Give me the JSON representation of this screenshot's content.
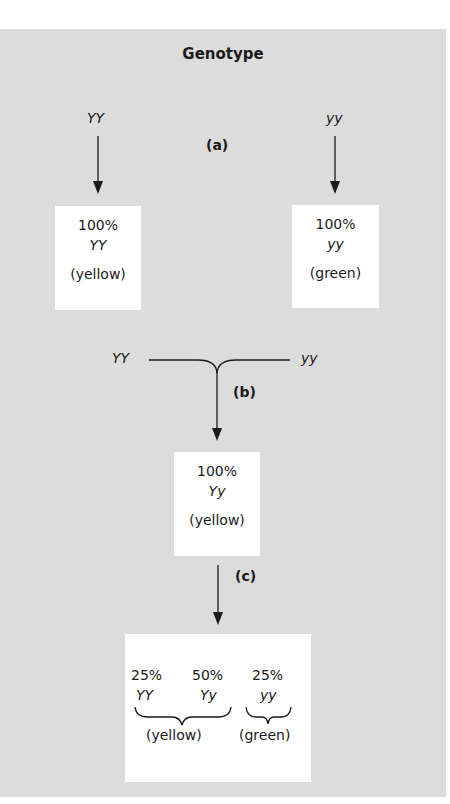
{
  "title": "Genotype",
  "steps": {
    "a": "(a)",
    "b": "(b)",
    "c": "(c)"
  },
  "parents": {
    "left_genotype": "YY",
    "right_genotype": "yy"
  },
  "parental_boxes": [
    {
      "percent": "100%",
      "genotype": "YY",
      "phenotype": "(yellow)"
    },
    {
      "percent": "100%",
      "genotype": "yy",
      "phenotype": "(green)"
    }
  ],
  "cross": {
    "left_genotype": "YY",
    "right_genotype": "yy"
  },
  "f1_box": {
    "percent": "100%",
    "genotype": "Yy",
    "phenotype": "(yellow)"
  },
  "f2_box": {
    "genotypes": [
      {
        "percent": "25%",
        "genotype": "YY"
      },
      {
        "percent": "50%",
        "genotype": "Yy"
      },
      {
        "percent": "25%",
        "genotype": "yy"
      }
    ],
    "phenotypes": [
      {
        "label": "(yellow)",
        "covers": [
          "YY",
          "Yy"
        ]
      },
      {
        "label": "(green)",
        "covers": [
          "yy"
        ]
      }
    ]
  },
  "colors": {
    "panel_background": "#dcdcdc",
    "box_background": "#ffffff",
    "ink": "#1a1a1a"
  }
}
